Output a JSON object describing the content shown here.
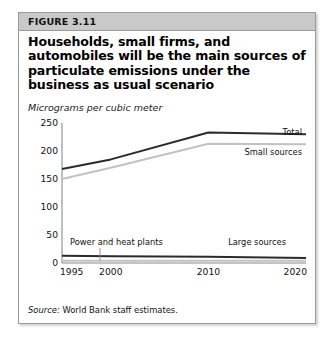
{
  "figure": {
    "label": "FIGURE 3.11",
    "title": "Households, small firms, and automobiles will be the main sources of particulate emissions under the business as usual scenario",
    "unit_subtitle": "Micrograms per cubic meter",
    "source_lead": "Source:",
    "source_text": " World Bank staff estimates."
  },
  "colors": {
    "header_band": "#c9c9c9",
    "box_border": "#9a9a9a",
    "dark_series": "#2b2b2b",
    "light_series": "#c2c2c2",
    "axis": "#8a8a8a",
    "text": "#111111"
  },
  "chart_data": {
    "type": "line",
    "title": "Households, small firms, and automobiles will be the main sources of particulate emissions under the business as usual scenario",
    "xlabel": "",
    "ylabel": "Micrograms per cubic meter",
    "x": [
      1995,
      2000,
      2010,
      2020
    ],
    "xtick_labels": [
      "1995",
      "2000",
      "2010",
      "2020"
    ],
    "ytick_labels": [
      "0",
      "50",
      "100",
      "150",
      "200",
      "250"
    ],
    "yticks": [
      0,
      50,
      100,
      150,
      200,
      250
    ],
    "ylim": [
      0,
      250
    ],
    "xlim": [
      1995,
      2020
    ],
    "grid": false,
    "legend": "inline-labels",
    "series": [
      {
        "name": "Total",
        "values": [
          168,
          185,
          233,
          230
        ],
        "color": "#2b2b2b"
      },
      {
        "name": "Small sources",
        "values": [
          150,
          170,
          213,
          212
        ],
        "color": "#c2c2c2"
      },
      {
        "name": "Large sources",
        "values": [
          13,
          12,
          11,
          9
        ],
        "color": "#2b2b2b"
      },
      {
        "name": "Power and heat plants",
        "values": [
          4,
          4,
          4,
          4
        ],
        "color": "#c2c2c2"
      }
    ],
    "annotations": [
      {
        "text": "Total",
        "series": "Total"
      },
      {
        "text": "Small sources",
        "series": "Small sources"
      },
      {
        "text": "Large sources",
        "series": "Large sources"
      },
      {
        "text": "Power and heat plants",
        "series": "Power and heat plants"
      }
    ]
  }
}
